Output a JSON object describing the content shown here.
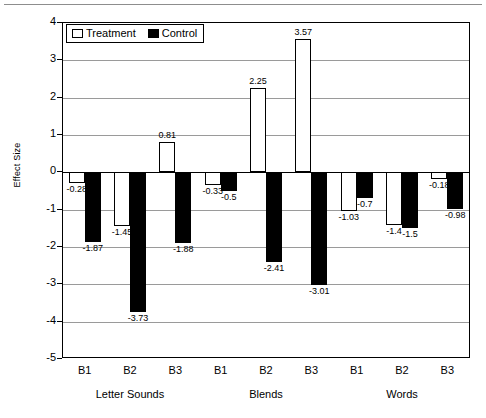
{
  "chart_data": {
    "type": "bar",
    "title": "",
    "xlabel": "",
    "ylabel": "Effect Size",
    "ylim": [
      -5,
      4
    ],
    "ytick_values": [
      4,
      3,
      2,
      1,
      0,
      -1,
      -2,
      -3,
      -4,
      -5
    ],
    "ytick_labels": [
      "4",
      "3",
      "2",
      "1",
      "0",
      "-1",
      "-2",
      "-3",
      "-4",
      "-5"
    ],
    "grid": true,
    "legend_position": "top-left",
    "categories": [
      "B1",
      "B2",
      "B3",
      "B1",
      "B2",
      "B3",
      "B1",
      "B2",
      "B3"
    ],
    "groups": [
      {
        "name": "Letter Sounds",
        "categories": [
          "B1",
          "B2",
          "B3"
        ]
      },
      {
        "name": "Blends",
        "categories": [
          "B1",
          "B2",
          "B3"
        ]
      },
      {
        "name": "Words",
        "categories": [
          "B1",
          "B2",
          "B3"
        ]
      }
    ],
    "series": [
      {
        "name": "Treatment",
        "color": "#ffffff",
        "values": [
          -0.28,
          -1.45,
          0.81,
          -0.33,
          2.25,
          3.57,
          -1.03,
          -1.4,
          -0.18
        ],
        "labels": [
          "-0.28",
          "-1.45",
          "0.81",
          "-0.33",
          "2.25",
          "3.57",
          "-1.03",
          "-1.4",
          "-0.18"
        ]
      },
      {
        "name": "Control",
        "color": "#000000",
        "values": [
          -1.87,
          -3.73,
          -1.88,
          -0.5,
          -2.41,
          -3.01,
          -0.7,
          -1.5,
          -0.98
        ],
        "labels": [
          "-1.87",
          "-3.73",
          "-1.88",
          "-0.5",
          "-2.41",
          "-3.01",
          "-0.7",
          "-1.5",
          "-0.98"
        ]
      }
    ]
  },
  "legend": {
    "items": [
      {
        "label": "Treatment",
        "swatch": "treatment"
      },
      {
        "label": "Control",
        "swatch": "control"
      }
    ]
  }
}
